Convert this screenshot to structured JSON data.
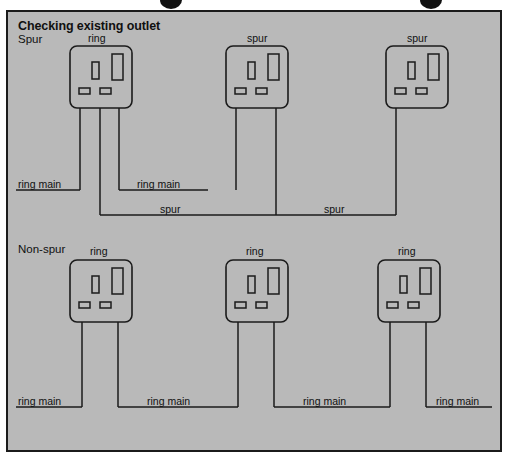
{
  "page": {
    "width": 510,
    "height": 461,
    "background": "#ffffff",
    "panel_background": "#b9b9b9",
    "line_color": "#1b1b1b",
    "text_color": "#101010"
  },
  "header": {
    "title": "Checking existing outlet"
  },
  "sections": [
    {
      "id": "spur",
      "label": "Spur",
      "sockets": [
        {
          "id": "spur-socket-1",
          "label": "ring",
          "wire_count": 3
        },
        {
          "id": "spur-socket-2",
          "label": "spur",
          "wire_count": 2
        },
        {
          "id": "spur-socket-3",
          "label": "spur",
          "wire_count": 1
        }
      ],
      "wire_labels": [
        {
          "id": "spur-ring-main-left",
          "text": "ring main"
        },
        {
          "id": "spur-ring-main-mid",
          "text": "ring main"
        },
        {
          "id": "spur-spur-left",
          "text": "spur"
        },
        {
          "id": "spur-spur-right",
          "text": "spur"
        }
      ]
    },
    {
      "id": "non-spur",
      "label": "Non-spur",
      "sockets": [
        {
          "id": "nonspur-socket-1",
          "label": "ring",
          "wire_count": 2
        },
        {
          "id": "nonspur-socket-2",
          "label": "ring",
          "wire_count": 2
        },
        {
          "id": "nonspur-socket-3",
          "label": "ring",
          "wire_count": 2
        }
      ],
      "wire_labels": [
        {
          "id": "nonspur-ring-main-1",
          "text": "ring main"
        },
        {
          "id": "nonspur-ring-main-2",
          "text": "ring main"
        },
        {
          "id": "nonspur-ring-main-3",
          "text": "ring main"
        },
        {
          "id": "nonspur-ring-main-4",
          "text": "ring main"
        }
      ]
    }
  ],
  "socket_face": {
    "description": "UK 13A socket outlet face",
    "parts": [
      "earth-slot",
      "live-slot",
      "neutral-slot-left",
      "neutral-slot-right"
    ]
  },
  "binding_marks": [
    {
      "id": "binding-mark-left",
      "x": 160
    },
    {
      "id": "binding-mark-right",
      "x": 420
    }
  ]
}
